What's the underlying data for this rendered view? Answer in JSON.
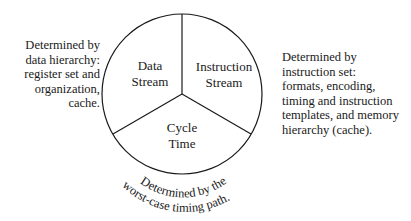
{
  "diagram": {
    "type": "pie-divided-circle",
    "segments": [
      {
        "id": "data-stream",
        "label": "Data\nStream"
      },
      {
        "id": "instruction-stream",
        "label": "Instruction\nStream"
      },
      {
        "id": "cycle-time",
        "label": "Cycle\nTime"
      }
    ],
    "annotations": {
      "left": "Determined by\ndata hierarchy:\nregister set and\norganization,\ncache.",
      "right": "Determined by\ninstruction set:\nformats, encoding,\ntiming and instruction\ntemplates, and memory\nhierarchy (cache).",
      "bottom_line1": "Determined by the",
      "bottom_line2": "worst-case timing path."
    },
    "colors": {
      "stroke": "#1a1a1a",
      "text": "#1a1a1a",
      "background": "#ffffff"
    }
  }
}
